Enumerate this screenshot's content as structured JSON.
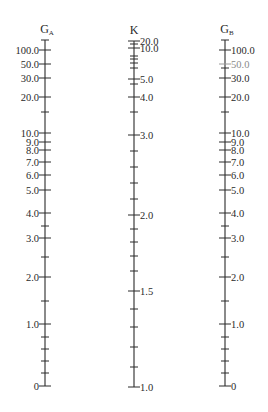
{
  "chart_data": {
    "type": "nomograph",
    "title": "",
    "axes": [
      {
        "id": "GA",
        "title": "G",
        "subscript": "A",
        "x": 45,
        "label_side": "left",
        "y_top": 40,
        "y_bottom": 386,
        "major_ticks": [
          {
            "label": "100.0",
            "value": 100.0,
            "y": 50
          },
          {
            "label": "50.0",
            "value": 50.0,
            "y": 64
          },
          {
            "label": "30.0",
            "value": 30.0,
            "y": 78
          },
          {
            "label": "20.0",
            "value": 20.0,
            "y": 97
          },
          {
            "label": "10.0",
            "value": 10.0,
            "y": 133
          },
          {
            "label": "9.0",
            "value": 9.0,
            "y": 142
          },
          {
            "label": "8.0",
            "value": 8.0,
            "y": 150
          },
          {
            "label": "7.0",
            "value": 7.0,
            "y": 162
          },
          {
            "label": "6.0",
            "value": 6.0,
            "y": 175
          },
          {
            "label": "5.0",
            "value": 5.0,
            "y": 190
          },
          {
            "label": "4.0",
            "value": 4.0,
            "y": 213
          },
          {
            "label": "3.0",
            "value": 3.0,
            "y": 238
          },
          {
            "label": "2.0",
            "value": 2.0,
            "y": 277
          },
          {
            "label": "1.0",
            "value": 1.0,
            "y": 324
          },
          {
            "label": "0",
            "value": 0,
            "y": 386
          }
        ],
        "minor_ticks_y": [
          40,
          112,
          226,
          257,
          301,
          337,
          349,
          361,
          373
        ]
      },
      {
        "id": "K",
        "title": "K",
        "subscript": "",
        "x": 134,
        "label_side": "right",
        "y_top": 41,
        "y_bottom": 387,
        "major_ticks": [
          {
            "label": "20.0",
            "value": 20.0,
            "y": 41
          },
          {
            "label": "10.0",
            "value": 10.0,
            "y": 48
          },
          {
            "label": "5.0",
            "value": 5.0,
            "y": 79
          },
          {
            "label": "4.0",
            "value": 4.0,
            "y": 97
          },
          {
            "label": "3.0",
            "value": 3.0,
            "y": 135
          },
          {
            "label": "2.0",
            "value": 2.0,
            "y": 215
          },
          {
            "label": "1.5",
            "value": 1.5,
            "y": 291
          },
          {
            "label": "1.0",
            "value": 1.0,
            "y": 387
          }
        ],
        "minor_ticks_y": [
          44,
          56,
          59,
          63,
          68,
          84,
          112,
          151,
          167,
          183,
          199,
          229,
          242,
          256,
          271,
          309,
          327,
          347,
          367
        ]
      },
      {
        "id": "GB",
        "title": "G",
        "subscript": "B",
        "x": 225,
        "label_side": "right",
        "y_top": 40,
        "y_bottom": 386,
        "major_ticks": [
          {
            "label": "100.0",
            "value": 100.0,
            "y": 50
          },
          {
            "label": "50.0",
            "value": 50.0,
            "y": 64,
            "faint": true
          },
          {
            "label": "30.0",
            "value": 30.0,
            "y": 78
          },
          {
            "label": "20.0",
            "value": 20.0,
            "y": 97
          },
          {
            "label": "10.0",
            "value": 10.0,
            "y": 133
          },
          {
            "label": "9.0",
            "value": 9.0,
            "y": 142
          },
          {
            "label": "8.0",
            "value": 8.0,
            "y": 150
          },
          {
            "label": "7.0",
            "value": 7.0,
            "y": 162
          },
          {
            "label": "6.0",
            "value": 6.0,
            "y": 175
          },
          {
            "label": "5.0",
            "value": 5.0,
            "y": 190
          },
          {
            "label": "4.0",
            "value": 4.0,
            "y": 213
          },
          {
            "label": "3.0",
            "value": 3.0,
            "y": 238
          },
          {
            "label": "2.0",
            "value": 2.0,
            "y": 277
          },
          {
            "label": "1.0",
            "value": 1.0,
            "y": 324
          },
          {
            "label": "0",
            "value": 0,
            "y": 386
          }
        ],
        "minor_ticks_y": [
          40,
          68,
          112,
          226,
          257,
          301,
          337,
          349,
          361,
          373
        ]
      }
    ]
  }
}
